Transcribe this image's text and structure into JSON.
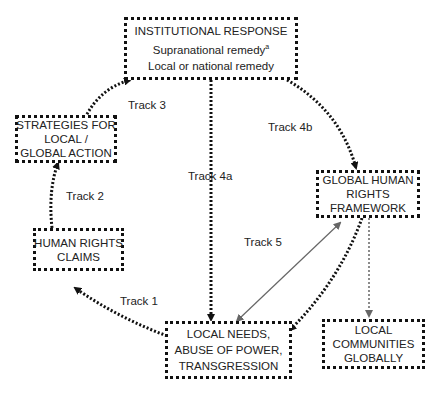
{
  "nodes": {
    "institutional": {
      "title": "INSTITUTIONAL RESPONSE",
      "line2": "Supranational remedy",
      "line2_sup": "a",
      "line3": "Local or national remedy"
    },
    "strategies": {
      "line1": "STRATEGIES FOR",
      "line2": "LOCAL /",
      "line3": "GLOBAL ACTION"
    },
    "claims": {
      "line1": "HUMAN RIGHTS",
      "line2": "CLAIMS"
    },
    "framework": {
      "line1": "GLOBAL HUMAN",
      "line2": "RIGHTS",
      "line3": "FRAMEWORK"
    },
    "local_needs": {
      "line1": "LOCAL NEEDS,",
      "line2": "ABUSE OF POWER,",
      "line3": "TRANSGRESSION"
    },
    "communities": {
      "line1": "LOCAL",
      "line2": "COMMUNITIES",
      "line3": "GLOBALLY"
    }
  },
  "tracks": {
    "t1": "Track 1",
    "t2": "Track 2",
    "t3": "Track 3",
    "t4a": "Track 4a",
    "t4b": "Track 4b",
    "t5": "Track 5"
  }
}
